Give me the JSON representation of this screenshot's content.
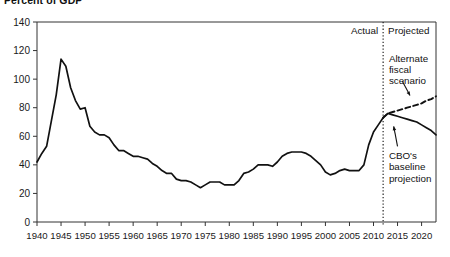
{
  "chart_data": {
    "type": "line",
    "title": "Percent of GDP",
    "xlabel": "",
    "ylabel": "",
    "xlim": [
      1940,
      2023
    ],
    "ylim": [
      0,
      140
    ],
    "ytick_step": 20,
    "xtick_step": 5,
    "yticks": [
      "0",
      "20",
      "40",
      "60",
      "80",
      "100",
      "120",
      "140"
    ],
    "xticks": [
      "1940",
      "1945",
      "1950",
      "1955",
      "1960",
      "1965",
      "1970",
      "1975",
      "1980",
      "1985",
      "1990",
      "1995",
      "2000",
      "2005",
      "2010",
      "2015",
      "2020"
    ],
    "grid": false,
    "legend_position": "none",
    "divider_year": 2012,
    "divider_style": "dotted",
    "period_labels": {
      "actual": "Actual",
      "projected": "Projected"
    },
    "annotations": [
      {
        "name": "alternate-fiscal-scenario",
        "text": "Alternate\nfiscal\nscenario",
        "lines": [
          "Alternate",
          "fiscal",
          "scenario"
        ],
        "x": 2013.2,
        "y": 112
      },
      {
        "name": "cbo-baseline-projection",
        "text": "CBO's\nbaseline\nprojection",
        "lines": [
          "CBO's",
          "baseline",
          "projection"
        ],
        "x": 2013.2,
        "y": 44
      }
    ],
    "series": [
      {
        "name": "Actual and CBO's baseline projection",
        "style": "solid",
        "color": "#111111",
        "x": [
          1940,
          1941,
          1942,
          1943,
          1944,
          1945,
          1946,
          1947,
          1948,
          1949,
          1950,
          1951,
          1952,
          1953,
          1954,
          1955,
          1956,
          1957,
          1958,
          1959,
          1960,
          1961,
          1962,
          1963,
          1964,
          1965,
          1966,
          1967,
          1968,
          1969,
          1970,
          1971,
          1972,
          1973,
          1974,
          1975,
          1976,
          1977,
          1978,
          1979,
          1980,
          1981,
          1982,
          1983,
          1984,
          1985,
          1986,
          1987,
          1988,
          1989,
          1990,
          1991,
          1992,
          1993,
          1994,
          1995,
          1996,
          1997,
          1998,
          1999,
          2000,
          2001,
          2002,
          2003,
          2004,
          2005,
          2006,
          2007,
          2008,
          2009,
          2010,
          2011,
          2012,
          2013,
          2014,
          2015,
          2016,
          2017,
          2018,
          2019,
          2020,
          2021,
          2022,
          2023
        ],
        "values": [
          42,
          48,
          53,
          71,
          89,
          114,
          109,
          94,
          85,
          79,
          80,
          67,
          63,
          61,
          61,
          59,
          54,
          50,
          50,
          48,
          46,
          46,
          45,
          44,
          41,
          39,
          36,
          34,
          34,
          30,
          29,
          29,
          28,
          26,
          24,
          26,
          28,
          28,
          28,
          26,
          26,
          26,
          29,
          34,
          35,
          37,
          40,
          40,
          40,
          39,
          42,
          46,
          48,
          49,
          49,
          49,
          48,
          46,
          43,
          40,
          35,
          33,
          34,
          36,
          37,
          36,
          36,
          36,
          40,
          54,
          63,
          68,
          73,
          76,
          75,
          74,
          73,
          72,
          71,
          70,
          68,
          66,
          64,
          61
        ]
      },
      {
        "name": "Alternate fiscal scenario",
        "style": "dashed",
        "color": "#111111",
        "x": [
          2012,
          2013,
          2014,
          2015,
          2016,
          2017,
          2018,
          2019,
          2020,
          2021,
          2022,
          2023
        ],
        "values": [
          73,
          76,
          77,
          78,
          79,
          80,
          81,
          82,
          83,
          85,
          86,
          88
        ]
      }
    ]
  }
}
